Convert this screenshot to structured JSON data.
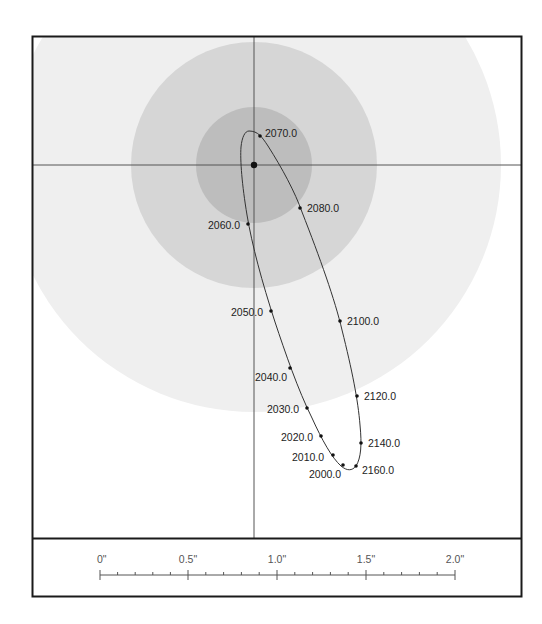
{
  "diagram": {
    "type": "binary-star-orbit",
    "center": {
      "x": 254,
      "y": 165
    },
    "zones": [
      {
        "name": "outer-zone",
        "radius": 247,
        "color": "#efefef"
      },
      {
        "name": "middle-zone",
        "radius": 123,
        "color": "#d6d6d6"
      },
      {
        "name": "inner-zone",
        "radius": 58,
        "color": "#bdbdbd"
      }
    ],
    "epochs": [
      {
        "label": "2000.0",
        "x": 343,
        "y": 465,
        "lx": 309,
        "ly": 478
      },
      {
        "label": "2010.0",
        "x": 333,
        "y": 455,
        "lx": 292,
        "ly": 461
      },
      {
        "label": "2020.0",
        "x": 321,
        "y": 436,
        "lx": 281,
        "ly": 441
      },
      {
        "label": "2030.0",
        "x": 307,
        "y": 408,
        "lx": 267,
        "ly": 413
      },
      {
        "label": "2040.0",
        "x": 290,
        "y": 368,
        "lx": 255,
        "ly": 381
      },
      {
        "label": "2050.0",
        "x": 271,
        "y": 311,
        "lx": 231,
        "ly": 316
      },
      {
        "label": "2060.0",
        "x": 248,
        "y": 224,
        "lx": 208,
        "ly": 229
      },
      {
        "label": "2070.0",
        "x": 260,
        "y": 136,
        "lx": 265,
        "ly": 137
      },
      {
        "label": "2080.0",
        "x": 300,
        "y": 208,
        "lx": 307,
        "ly": 212
      },
      {
        "label": "2100.0",
        "x": 340,
        "y": 321,
        "lx": 347,
        "ly": 325
      },
      {
        "label": "2120.0",
        "x": 357,
        "y": 396,
        "lx": 364,
        "ly": 400
      },
      {
        "label": "2140.0",
        "x": 361,
        "y": 443,
        "lx": 368,
        "ly": 447
      },
      {
        "label": "2160.0",
        "x": 356,
        "y": 466,
        "lx": 362,
        "ly": 474
      }
    ],
    "scale_bar": {
      "unit": "arcsec",
      "ticks_major": [
        {
          "label": "0\"",
          "x": 100
        },
        {
          "label": "0.5\"",
          "x": 188
        },
        {
          "label": "1.0\"",
          "x": 277
        },
        {
          "label": "1.5\"",
          "x": 366
        },
        {
          "label": "2.0\"",
          "x": 455
        }
      ],
      "minor_per_major": 5
    }
  },
  "colors": {
    "frame": "#1a1a1a",
    "crosshair": "#555555",
    "orbit": "#333333",
    "dot": "#111111"
  }
}
